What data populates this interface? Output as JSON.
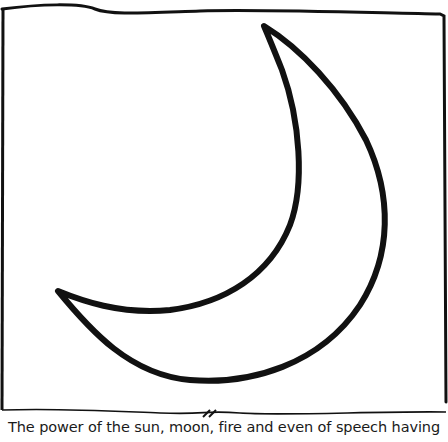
{
  "illustration": {
    "subject": "crescent-moon",
    "stroke_color": "#111111",
    "background": "#ffffff"
  },
  "divider": {
    "mark": "//"
  },
  "caption": {
    "text": "The power of the sun, moon, fire and even of speech having"
  }
}
